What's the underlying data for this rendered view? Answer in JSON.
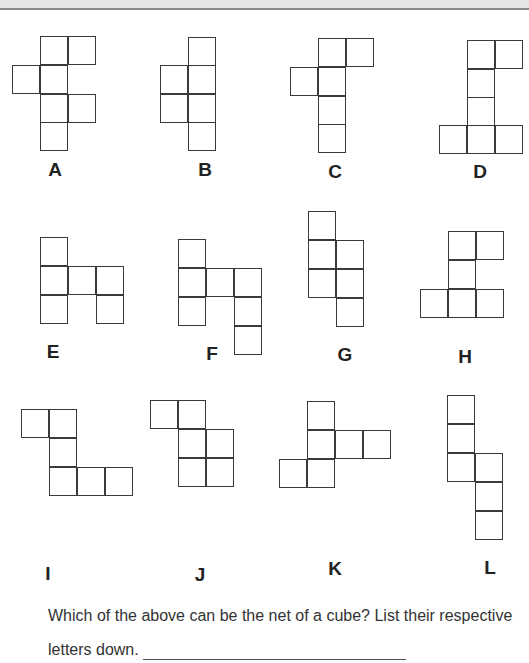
{
  "worksheet": {
    "question_line1": "Which of the above can be the net of a cube? List their respective",
    "question_line2": "letters down.",
    "answer_value": ""
  },
  "nets": [
    {
      "label": "A",
      "label_pos": [
        55,
        170
      ],
      "cells": [
        [
          40,
          36
        ],
        [
          68,
          36
        ],
        [
          12,
          65
        ],
        [
          40,
          65
        ],
        [
          40,
          94
        ],
        [
          68,
          94
        ],
        [
          40,
          122
        ]
      ]
    },
    {
      "label": "B",
      "label_pos": [
        205,
        170
      ],
      "cells": [
        [
          188,
          37
        ],
        [
          160,
          65
        ],
        [
          188,
          65
        ],
        [
          160,
          94
        ],
        [
          188,
          94
        ],
        [
          188,
          122
        ]
      ]
    },
    {
      "label": "C",
      "label_pos": [
        335,
        172
      ],
      "cells": [
        [
          318,
          38
        ],
        [
          346,
          38
        ],
        [
          290,
          67
        ],
        [
          318,
          67
        ],
        [
          318,
          96
        ],
        [
          318,
          124
        ]
      ]
    },
    {
      "label": "D",
      "label_pos": [
        480,
        172
      ],
      "cells": [
        [
          467,
          40
        ],
        [
          495,
          40
        ],
        [
          467,
          69
        ],
        [
          467,
          97
        ],
        [
          439,
          125
        ],
        [
          467,
          125
        ],
        [
          495,
          125
        ]
      ]
    },
    {
      "label": "E",
      "label_pos": [
        53,
        352
      ],
      "cells": [
        [
          40,
          237
        ],
        [
          40,
          266
        ],
        [
          68,
          266
        ],
        [
          96,
          266
        ],
        [
          40,
          295
        ],
        [
          96,
          295
        ]
      ]
    },
    {
      "label": "F",
      "label_pos": [
        212,
        354
      ],
      "cells": [
        [
          178,
          239
        ],
        [
          178,
          268
        ],
        [
          206,
          268
        ],
        [
          234,
          268
        ],
        [
          178,
          297
        ],
        [
          234,
          297
        ],
        [
          234,
          326
        ]
      ]
    },
    {
      "label": "G",
      "label_pos": [
        345,
        355
      ],
      "cells": [
        [
          308,
          211
        ],
        [
          308,
          240
        ],
        [
          336,
          240
        ],
        [
          308,
          269
        ],
        [
          336,
          269
        ],
        [
          336,
          298
        ]
      ]
    },
    {
      "label": "H",
      "label_pos": [
        465,
        357
      ],
      "cells": [
        [
          448,
          231
        ],
        [
          476,
          231
        ],
        [
          448,
          260
        ],
        [
          420,
          289
        ],
        [
          448,
          289
        ],
        [
          476,
          289
        ]
      ]
    },
    {
      "label": "I",
      "label_pos": [
        48,
        574
      ],
      "cells": [
        [
          21,
          409
        ],
        [
          49,
          409
        ],
        [
          49,
          438
        ],
        [
          49,
          467
        ],
        [
          77,
          467
        ],
        [
          105,
          467
        ]
      ]
    },
    {
      "label": "J",
      "label_pos": [
        200,
        575
      ],
      "cells": [
        [
          150,
          400
        ],
        [
          178,
          400
        ],
        [
          178,
          429
        ],
        [
          206,
          429
        ],
        [
          178,
          458
        ],
        [
          206,
          458
        ]
      ]
    },
    {
      "label": "K",
      "label_pos": [
        335,
        569
      ],
      "cells": [
        [
          307,
          401
        ],
        [
          307,
          430
        ],
        [
          335,
          430
        ],
        [
          363,
          430
        ],
        [
          279,
          459
        ],
        [
          307,
          459
        ]
      ]
    },
    {
      "label": "L",
      "label_pos": [
        490,
        568
      ],
      "cells": [
        [
          447,
          395
        ],
        [
          447,
          424
        ],
        [
          447,
          453
        ],
        [
          475,
          453
        ],
        [
          475,
          482
        ],
        [
          475,
          511
        ]
      ]
    }
  ]
}
